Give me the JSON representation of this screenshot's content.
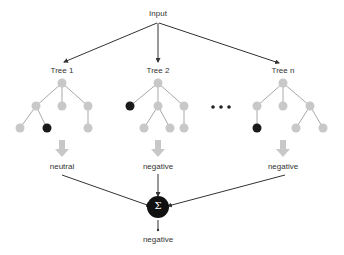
{
  "diagram": {
    "input_label": "Input",
    "trees": [
      {
        "label": "Tree 1",
        "output": "neutral"
      },
      {
        "label": "Tree 2",
        "output": "negative"
      },
      {
        "label": "Tree n",
        "output": "negative"
      }
    ],
    "ellipsis": "•••",
    "aggregator_symbol": "Σ",
    "final_output": "negative",
    "colors": {
      "node": "#c8c8c8",
      "leaf_selected": "#1a1a1a",
      "edge": "#a8a8a8",
      "arrow": "#c8c8c8",
      "line": "#333333"
    }
  }
}
